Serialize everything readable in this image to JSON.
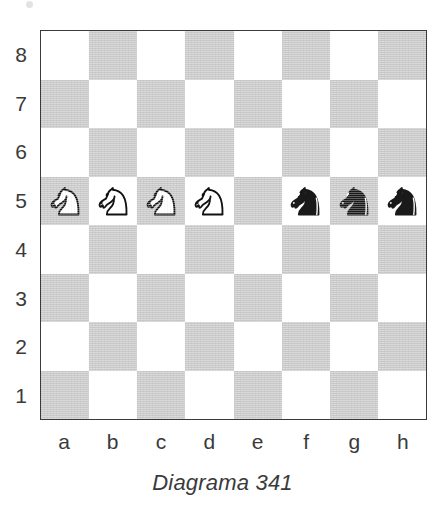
{
  "diagram": {
    "caption": "Diagrama 341",
    "rank_labels": [
      "8",
      "7",
      "6",
      "5",
      "4",
      "3",
      "2",
      "1"
    ],
    "file_labels": [
      "a",
      "b",
      "c",
      "d",
      "e",
      "f",
      "g",
      "h"
    ],
    "colors": {
      "light_square": "#ffffff",
      "dark_square": "#cacaca",
      "border": "#3a3a3a",
      "text": "#3a3a3a",
      "white_piece_fill": "#ffffff",
      "white_piece_outline": "#111111",
      "black_piece_fill": "#1a1a1a"
    }
  },
  "chart_data": {
    "type": "table",
    "title": "Diagrama 341",
    "xlabel": "",
    "ylabel": "",
    "files": [
      "a",
      "b",
      "c",
      "d",
      "e",
      "f",
      "g",
      "h"
    ],
    "ranks": [
      "8",
      "7",
      "6",
      "5",
      "4",
      "3",
      "2",
      "1"
    ],
    "pieces": [
      {
        "square": "a5",
        "piece": "knight",
        "color": "white",
        "glyph": "white-knight"
      },
      {
        "square": "b5",
        "piece": "knight",
        "color": "white",
        "glyph": "white-knight"
      },
      {
        "square": "c5",
        "piece": "knight",
        "color": "white",
        "glyph": "white-knight"
      },
      {
        "square": "d5",
        "piece": "knight",
        "color": "white",
        "glyph": "white-knight"
      },
      {
        "square": "f5",
        "piece": "knight",
        "color": "black",
        "glyph": "black-knight"
      },
      {
        "square": "g5",
        "piece": "knight",
        "color": "black",
        "glyph": "black-knight"
      },
      {
        "square": "h5",
        "piece": "knight",
        "color": "black",
        "glyph": "black-knight"
      }
    ],
    "white_pieces": [
      "Na5",
      "Nb5",
      "Nc5",
      "Nd5"
    ],
    "black_pieces": [
      "Nf5",
      "Ng5",
      "Nh5"
    ],
    "empty_notable": [
      "e5"
    ],
    "fen_placement": "8/8/8/NNNN1nnn/8/8/8/8"
  }
}
